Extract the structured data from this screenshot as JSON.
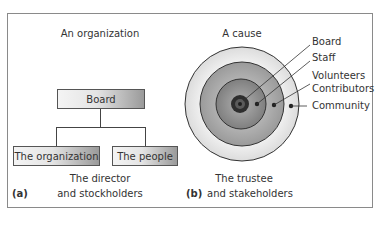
{
  "panel_a": {
    "title": "An organization",
    "root_box": "Board",
    "children": [
      "The organization",
      "The people"
    ],
    "caption_line1": "The director",
    "caption_line2": "and stockholders",
    "label": "(a)"
  },
  "panel_b": {
    "title": "A cause",
    "rings": [
      {
        "name": "Community",
        "radius": 57,
        "color": "#ececec"
      },
      {
        "name": "Contributors",
        "radius": 42,
        "color": "#a9a9a9"
      },
      {
        "name": "Volunteers / Staff",
        "radius": 25,
        "color": "#8d8d8d"
      },
      {
        "name": "Board",
        "radius": 9,
        "color": "#3a3a3a"
      }
    ],
    "labels": [
      "Board",
      "Staff",
      "Volunteers",
      "Contributors",
      "Community"
    ],
    "caption_line1": "The trustee",
    "caption_line2": "and stakeholders",
    "label": "(b)"
  }
}
